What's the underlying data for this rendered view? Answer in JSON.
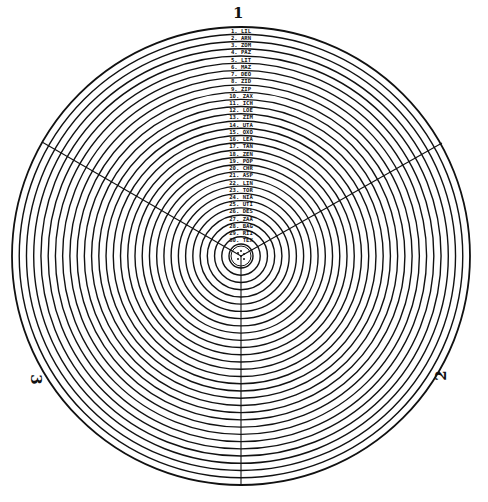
{
  "diagram": {
    "center": {
      "x": 241,
      "y": 256
    },
    "outer_radius": 229,
    "inner_radius": 12,
    "ring_count": 30,
    "stroke_color": "#111111",
    "background_color": "#ffffff",
    "section_labels": {
      "top": "1",
      "left": "3",
      "right": "2"
    },
    "dividers": [
      {
        "name": "vertical-down",
        "x1": 241,
        "y1": 256,
        "x2": 241,
        "y2": 485
      },
      {
        "name": "upper-left",
        "x1": 241,
        "y1": 256,
        "x2": 42,
        "y2": 142
      },
      {
        "name": "upper-right",
        "x1": 241,
        "y1": 256,
        "x2": 442,
        "y2": 143
      }
    ],
    "rings": [
      {
        "n": "1",
        "name": "LIL"
      },
      {
        "n": "2",
        "name": "ARN"
      },
      {
        "n": "3",
        "name": "ZOM"
      },
      {
        "n": "4",
        "name": "PAZ"
      },
      {
        "n": "5",
        "name": "LIT"
      },
      {
        "n": "6",
        "name": "MAZ"
      },
      {
        "n": "7",
        "name": "DEO"
      },
      {
        "n": "8",
        "name": "ZID"
      },
      {
        "n": "9",
        "name": "ZIP"
      },
      {
        "n": "10",
        "name": "ZAX"
      },
      {
        "n": "11",
        "name": "ICH"
      },
      {
        "n": "12",
        "name": "LOE"
      },
      {
        "n": "13",
        "name": "ZIM"
      },
      {
        "n": "14",
        "name": "UTA"
      },
      {
        "n": "15",
        "name": "OXO"
      },
      {
        "n": "16",
        "name": "LEA"
      },
      {
        "n": "17",
        "name": "TAN"
      },
      {
        "n": "18",
        "name": "ZEN"
      },
      {
        "n": "19",
        "name": "POP"
      },
      {
        "n": "20",
        "name": "CHR"
      },
      {
        "n": "21",
        "name": "ASP"
      },
      {
        "n": "22",
        "name": "LIN"
      },
      {
        "n": "23",
        "name": "TOR"
      },
      {
        "n": "24",
        "name": "NIA"
      },
      {
        "n": "25",
        "name": "UTI"
      },
      {
        "n": "26",
        "name": "DES"
      },
      {
        "n": "27",
        "name": "ZAA"
      },
      {
        "n": "28",
        "name": "BAG"
      },
      {
        "n": "29",
        "name": "RII"
      },
      {
        "n": "30",
        "name": "TEX"
      }
    ]
  }
}
